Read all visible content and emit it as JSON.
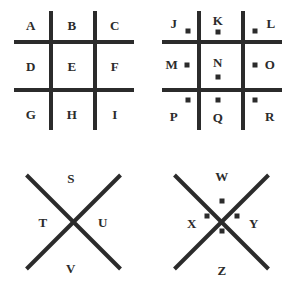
{
  "diagram": {
    "stroke_color": "#2b2b2b",
    "background_color": "#ffffff",
    "panels": [
      {
        "id": "grid-plain",
        "shape": "grid",
        "dotted": false,
        "cells": [
          {
            "letter": "A",
            "dot": "none"
          },
          {
            "letter": "B",
            "dot": "none"
          },
          {
            "letter": "C",
            "dot": "none"
          },
          {
            "letter": "D",
            "dot": "none"
          },
          {
            "letter": "E",
            "dot": "none"
          },
          {
            "letter": "F",
            "dot": "none"
          },
          {
            "letter": "G",
            "dot": "none"
          },
          {
            "letter": "H",
            "dot": "none"
          },
          {
            "letter": "I",
            "dot": "none"
          }
        ]
      },
      {
        "id": "grid-dotted",
        "shape": "grid",
        "dotted": true,
        "cells": [
          {
            "letter": "J",
            "dot": "bottom-right"
          },
          {
            "letter": "K",
            "dot": "bottom-center"
          },
          {
            "letter": "L",
            "dot": "bottom-left"
          },
          {
            "letter": "M",
            "dot": "middle-right"
          },
          {
            "letter": "N",
            "dot": "bottom-center"
          },
          {
            "letter": "O",
            "dot": "middle-left"
          },
          {
            "letter": "P",
            "dot": "top-right"
          },
          {
            "letter": "Q",
            "dot": "top-center"
          },
          {
            "letter": "R",
            "dot": "top-left"
          }
        ]
      },
      {
        "id": "cross-plain",
        "shape": "cross",
        "dotted": false,
        "cells": [
          {
            "letter": "S",
            "dot": "none"
          },
          {
            "letter": "T",
            "dot": "none"
          },
          {
            "letter": "U",
            "dot": "none"
          },
          {
            "letter": "V",
            "dot": "none"
          }
        ]
      },
      {
        "id": "cross-dotted",
        "shape": "cross",
        "dotted": true,
        "cells": [
          {
            "letter": "W",
            "dot": "below-top"
          },
          {
            "letter": "X",
            "dot": "right-of-left"
          },
          {
            "letter": "Y",
            "dot": "left-of-right"
          },
          {
            "letter": "Z",
            "dot": "above-bottom"
          }
        ]
      }
    ]
  }
}
